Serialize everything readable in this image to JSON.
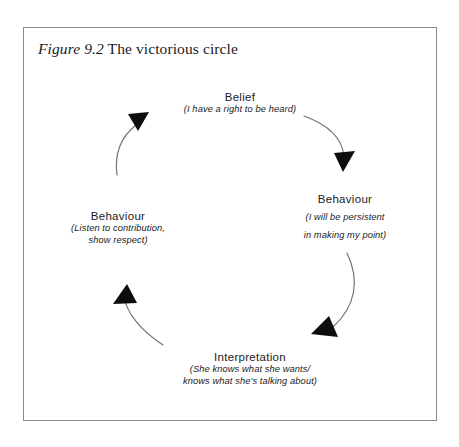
{
  "figure": {
    "caption_label": "Figure 9.2",
    "caption_text": "The victorious circle"
  },
  "diagram": {
    "type": "cycle",
    "direction": "clockwise",
    "nodes": [
      {
        "id": "belief",
        "position": "top",
        "title": "Belief",
        "subtitle_lines": [
          "(I have a right to be heard)"
        ]
      },
      {
        "id": "behaviour-right",
        "position": "right",
        "title": "Behaviour",
        "subtitle_lines": [
          "(I will be persistent",
          "in making my point)"
        ]
      },
      {
        "id": "interpretation",
        "position": "bottom",
        "title": "Interpretation",
        "subtitle_lines": [
          "(She knows what she wants/",
          "knows what she's talking about)"
        ]
      },
      {
        "id": "behaviour-left",
        "position": "left",
        "title": "Behaviour",
        "subtitle_lines": [
          "(Listen to contribution,",
          "show respect)"
        ]
      }
    ],
    "arrows": [
      {
        "id": "belief-to-behaviour-right",
        "from": "belief",
        "to": "behaviour-right",
        "points": "down"
      },
      {
        "id": "behaviour-right-to-interpretation",
        "from": "behaviour-right",
        "to": "interpretation",
        "points": "down-left"
      },
      {
        "id": "interpretation-to-behaviour-left",
        "from": "interpretation",
        "to": "behaviour-left",
        "points": "up"
      },
      {
        "id": "behaviour-left-to-belief",
        "from": "behaviour-left",
        "to": "belief",
        "points": "up-right"
      }
    ]
  },
  "colors": {
    "frame_border": "#8b8b8b",
    "arrow_stroke": "#6f6f6f",
    "arrow_head": "#0d0d0d",
    "text": "#1b1b1b",
    "background": "#ffffff"
  }
}
